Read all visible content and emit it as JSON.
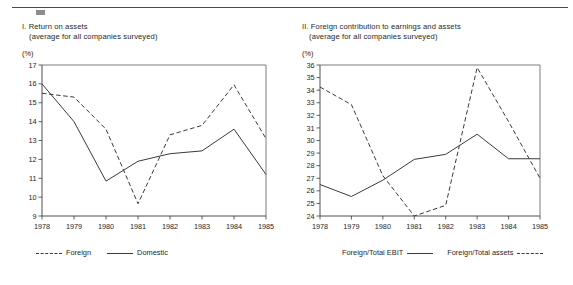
{
  "document": {
    "top_rule": true
  },
  "panels": [
    {
      "id": "return-on-assets",
      "title_main": "I. Return on assets",
      "title_sub": "(average for all companies surveyed)",
      "unit_label": "(%)",
      "legend": [
        {
          "label": "Foreign",
          "style": "dashed",
          "swatch_first": true
        },
        {
          "label": "Domestic",
          "style": "solid",
          "swatch_first": true
        }
      ]
    },
    {
      "id": "foreign-contribution",
      "title_main": "II. Foreign contribution to earnings and assets",
      "title_sub": "(average for all companies surveyed)",
      "unit_label": "(%)",
      "legend": [
        {
          "label": "Foreign/Total EBIT",
          "style": "solid",
          "swatch_first": false
        },
        {
          "label": "Foreign/Total assets",
          "style": "dashed",
          "swatch_first": false
        }
      ]
    }
  ],
  "chart_data": [
    {
      "type": "line",
      "id": "return-on-assets",
      "title": "I. Return on assets",
      "subtitle": "(average for all companies surveyed)",
      "xlabel": "",
      "ylabel": "(%)",
      "grid": false,
      "legend_position": "below",
      "x": [
        1978,
        1979,
        1980,
        1981,
        1982,
        1983,
        1984,
        1985
      ],
      "xticklabels": [
        "1978",
        "1979",
        "1980",
        "1981",
        "1982",
        "1983",
        "1984",
        "1985"
      ],
      "ylim": [
        9,
        17
      ],
      "yticks": [
        9,
        10,
        11,
        12,
        13,
        14,
        15,
        16,
        17
      ],
      "yticklabels": [
        "9",
        "10",
        "11",
        "12",
        "13",
        "14",
        "15",
        "16",
        "17"
      ],
      "series": [
        {
          "name": "Foreign",
          "style": "dashed",
          "values": [
            15.5,
            15.3,
            13.6,
            9.65,
            13.3,
            13.8,
            15.95,
            13.1
          ]
        },
        {
          "name": "Domestic",
          "style": "solid",
          "values": [
            16.0,
            14.0,
            10.85,
            11.9,
            12.3,
            12.45,
            13.6,
            11.2
          ]
        }
      ]
    },
    {
      "type": "line",
      "id": "foreign-contribution",
      "title": "II. Foreign contribution to earnings and assets",
      "subtitle": "(average for all companies surveyed)",
      "xlabel": "",
      "ylabel": "(%)",
      "grid": false,
      "legend_position": "below",
      "x": [
        1978,
        1979,
        1980,
        1981,
        1982,
        1983,
        1984,
        1985
      ],
      "xticklabels": [
        "1978",
        "1979",
        "1980",
        "1981",
        "1982",
        "1983",
        "1984",
        "1985"
      ],
      "ylim": [
        24,
        36
      ],
      "yticks": [
        24,
        25,
        26,
        27,
        28,
        29,
        30,
        31,
        32,
        33,
        34,
        35,
        36
      ],
      "yticklabels": [
        "24",
        "25",
        "26",
        "27",
        "28",
        "29",
        "30",
        "31",
        "32",
        "33",
        "34",
        "35",
        "36"
      ],
      "series": [
        {
          "name": "Foreign/Total EBIT",
          "style": "solid",
          "values": [
            26.5,
            25.55,
            26.85,
            28.5,
            28.9,
            30.5,
            28.55,
            28.55
          ]
        },
        {
          "name": "Foreign/Total assets",
          "style": "dashed",
          "values": [
            34.25,
            32.85,
            27.2,
            24.0,
            24.85,
            35.8,
            31.5,
            27.0
          ]
        }
      ]
    }
  ]
}
